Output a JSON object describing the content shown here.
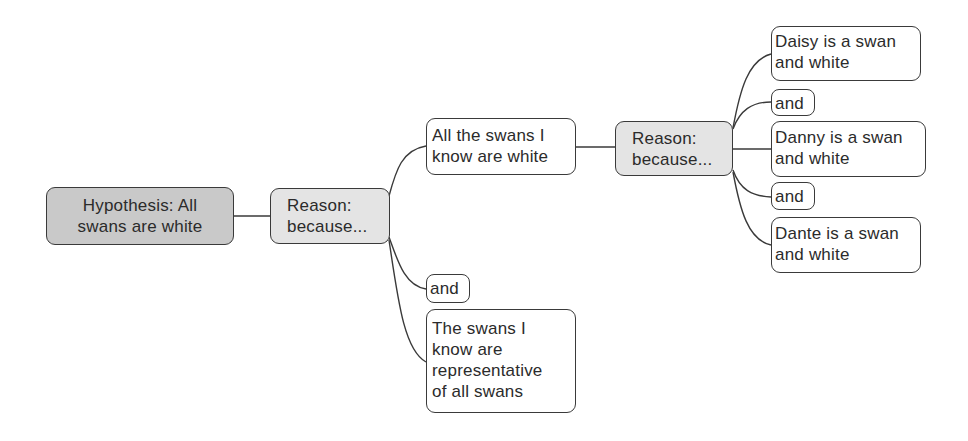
{
  "diagram": {
    "type": "argument-map",
    "colors": {
      "hypothesis_fill": "#c9c9c9",
      "reason_fill": "#e4e4e4",
      "claim_fill": "#ffffff",
      "stroke": "#3a3a3a",
      "text": "#2b2b2b"
    },
    "nodes": {
      "hypothesis": {
        "label": "Hypothesis: All\nswans are white"
      },
      "reason1": {
        "label": "Reason:\nbecause..."
      },
      "claim_all_swans_known": {
        "label": "All the swans I\nknow are white"
      },
      "and1": {
        "label": "and"
      },
      "claim_representative": {
        "label": "The swans I\nknow are\nrepresentative\nof all swans"
      },
      "reason2": {
        "label": "Reason:\nbecause..."
      },
      "claim_daisy": {
        "label": "Daisy is a swan\nand white"
      },
      "and2": {
        "label": "and"
      },
      "claim_danny": {
        "label": "Danny is a swan\nand white"
      },
      "and3": {
        "label": "and"
      },
      "claim_dante": {
        "label": "Dante is a swan\nand white"
      }
    },
    "edges": [
      [
        "hypothesis",
        "reason1"
      ],
      [
        "reason1",
        "claim_all_swans_known"
      ],
      [
        "reason1",
        "and1"
      ],
      [
        "reason1",
        "claim_representative"
      ],
      [
        "claim_all_swans_known",
        "reason2"
      ],
      [
        "reason2",
        "claim_daisy"
      ],
      [
        "reason2",
        "and2"
      ],
      [
        "reason2",
        "claim_danny"
      ],
      [
        "reason2",
        "and3"
      ],
      [
        "reason2",
        "claim_dante"
      ]
    ]
  }
}
